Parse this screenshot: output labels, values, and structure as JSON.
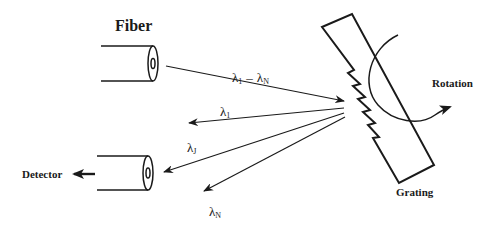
{
  "diagram": {
    "labels": {
      "fiber": "Fiber",
      "detector": "Detector",
      "grating": "Grating",
      "rotation": "Rotation",
      "incident_beam": "λ1 – λN",
      "lambda_1_sym": "λ",
      "lambda_1_sub": "1",
      "lambda_j_sym": "λ",
      "lambda_j_sub": "J",
      "lambda_n_sym": "λ",
      "lambda_n_sub": "N",
      "incident_sym1": "λ",
      "incident_sub1": "1",
      "incident_dash": "–",
      "incident_sym2": "λ",
      "incident_sub2": "N"
    },
    "components": [
      {
        "name": "input-fiber",
        "label": "Fiber"
      },
      {
        "name": "diffraction-grating",
        "label": "Grating"
      },
      {
        "name": "output-fiber",
        "label": "Detector"
      }
    ],
    "beams": [
      {
        "name": "incident",
        "label": "λ1 – λN",
        "direction": "fiber-to-grating"
      },
      {
        "name": "diffracted-1",
        "label": "λ1"
      },
      {
        "name": "diffracted-J",
        "label": "λJ",
        "target": "detector fiber"
      },
      {
        "name": "diffracted-N",
        "label": "λN"
      }
    ],
    "colors": {
      "ink": "#1a1a1a",
      "background": "#ffffff"
    }
  }
}
